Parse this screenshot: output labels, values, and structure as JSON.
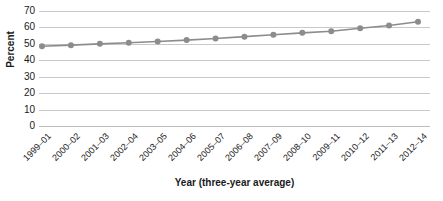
{
  "chart_data": {
    "type": "line",
    "title": "",
    "xlabel": "Year (three-year average)",
    "ylabel": "Percent",
    "categories": [
      "1999–01",
      "2000–02",
      "2001–03",
      "2002–04",
      "2003–05",
      "2004–06",
      "2005–07",
      "2006–08",
      "2007–09",
      "2008–10",
      "2009–11",
      "2010–12",
      "2011–13",
      "2012–14"
    ],
    "values": [
      48.5,
      49.2,
      50.0,
      50.7,
      51.4,
      52.3,
      53.3,
      54.4,
      55.5,
      56.7,
      57.7,
      59.5,
      61.2,
      63.5
    ],
    "ylim": [
      0,
      70
    ],
    "ytick_labels": [
      "0",
      "10",
      "20",
      "30",
      "40",
      "50",
      "60",
      "70"
    ],
    "ytick_values": [
      0,
      10,
      20,
      30,
      40,
      50,
      60,
      70
    ],
    "grid": true,
    "legend": "none",
    "series_color": "#8c8c8c",
    "grid_color": "#c9c9c9",
    "marker": "circle",
    "marker_size": 3
  }
}
